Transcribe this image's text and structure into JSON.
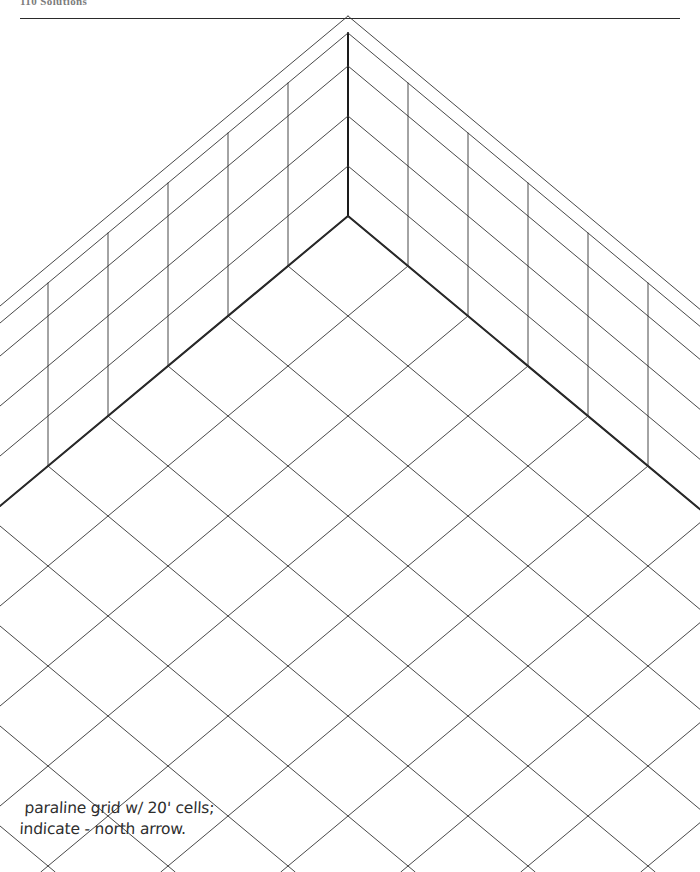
{
  "page": {
    "width": 700,
    "height": 872,
    "background_color": "#ffffff",
    "ink_color": "#333333",
    "heavy_ink_color": "#1a1a1a"
  },
  "header": {
    "title": "110 Solutions",
    "rule_label": "horizontal-rule"
  },
  "drawing": {
    "title": "paraline grid",
    "description": "Axonometric paraline grid: two vertical wall planes meeting at a central corner with a horizontal floor plane of diamond cells",
    "apex_point": {
      "x": 348,
      "y": 33
    },
    "corner_point": {
      "x": 348,
      "y": 216
    },
    "cell_dx": 60,
    "cell_dy": 50,
    "wall_rows": 4,
    "floor_rows": 7,
    "floor_cols": 7,
    "line_weights": {
      "light": 0.9,
      "heavy": 2.0
    }
  },
  "caption": {
    "line_1": "paraline grid  w/ 20' cells;",
    "line_2": "indicate - north arrow."
  }
}
